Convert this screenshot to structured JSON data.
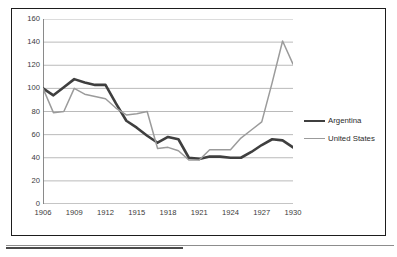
{
  "chart_data": {
    "type": "line",
    "title": "",
    "subtitle": "",
    "xlabel": "",
    "ylabel": "",
    "x": [
      1906,
      1907,
      1908,
      1909,
      1910,
      1911,
      1912,
      1913,
      1914,
      1915,
      1916,
      1917,
      1918,
      1919,
      1920,
      1921,
      1922,
      1923,
      1924,
      1925,
      1926,
      1927,
      1928,
      1929,
      1930
    ],
    "xlim": [
      1906,
      1930
    ],
    "ylim": [
      0,
      160
    ],
    "y_ticks": [
      0,
      20,
      40,
      60,
      80,
      100,
      120,
      140,
      160
    ],
    "x_tick_labels": [
      "1906",
      "1909",
      "1912",
      "1915",
      "1918",
      "1921",
      "1924",
      "1927",
      "1930"
    ],
    "x_tick_label_years": [
      1906,
      1909,
      1912,
      1915,
      1918,
      1921,
      1924,
      1927,
      1930
    ],
    "x_minor_tick_interval": 1,
    "grid": "horizontal",
    "legend_position": "right",
    "series": [
      {
        "name": "Argentina",
        "color": "#3f3f3f",
        "width": 2.6,
        "values": [
          100,
          94,
          101,
          108,
          105,
          103,
          103,
          87,
          72,
          66,
          59,
          53,
          58,
          56,
          40,
          39,
          41,
          41,
          40,
          40,
          45,
          51,
          56,
          55,
          49
        ]
      },
      {
        "name": "United States",
        "color": "#9b9b9b",
        "width": 1.5,
        "values": [
          100,
          79,
          80,
          100,
          95,
          93,
          91,
          83,
          77,
          78,
          80,
          48,
          49,
          46,
          38,
          38,
          47,
          47,
          47,
          57,
          64,
          71,
          105,
          141,
          121
        ]
      }
    ]
  },
  "legend": {
    "items": [
      {
        "label": "Argentina"
      },
      {
        "label": "United States"
      }
    ]
  },
  "axes": {
    "y_tick_labels": [
      "160",
      "140",
      "120",
      "100",
      "80",
      "60",
      "40",
      "20",
      "0"
    ],
    "x_tick_labels": [
      "1906",
      "1909",
      "1912",
      "1915",
      "1918",
      "1921",
      "1924",
      "1927",
      "1930"
    ]
  },
  "colors": {
    "argentina": "#3f3f3f",
    "united_states": "#9b9b9b",
    "frame": "#1d1d1d",
    "gridline": "#a8a8a8",
    "axis": "#7d7d7d",
    "background": "#ffffff"
  }
}
